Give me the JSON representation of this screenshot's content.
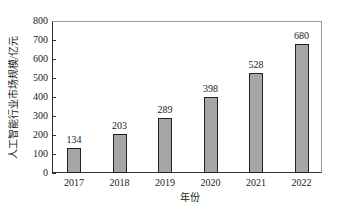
{
  "chart_data": {
    "type": "bar",
    "title": "",
    "xlabel": "年份",
    "ylabel": "人工智能行业市场规模/亿元",
    "categories": [
      "2017",
      "2018",
      "2019",
      "2020",
      "2021",
      "2022"
    ],
    "values": [
      134,
      203,
      289,
      398,
      528,
      680
    ],
    "data_labels": [
      "134",
      "203",
      "289",
      "398",
      "528",
      "680"
    ],
    "ylim": [
      0,
      800
    ],
    "yticks": [
      "0",
      "100",
      "200",
      "300",
      "400",
      "500",
      "600",
      "700",
      "800"
    ],
    "grid": false,
    "legend": null,
    "bar_color": "#a6a6a6"
  }
}
